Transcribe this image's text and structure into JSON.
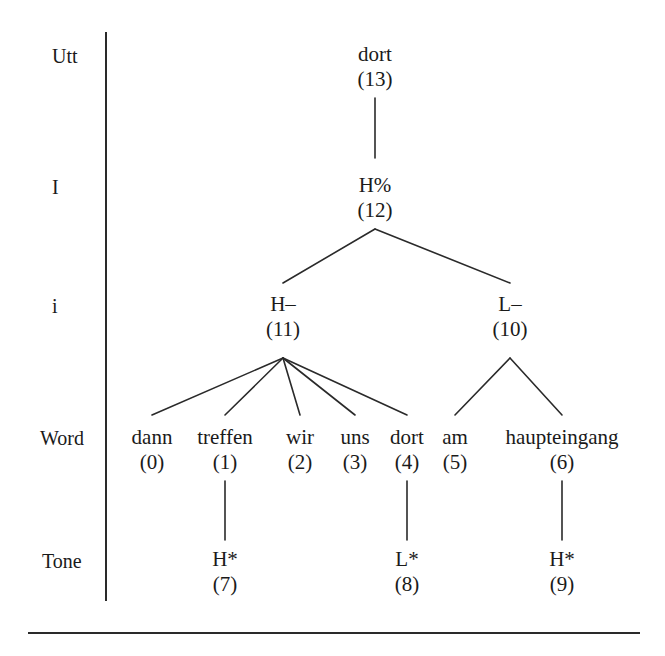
{
  "figure": {
    "ink_color": "#1a1a1a",
    "line_color": "#2a2a2a",
    "background": "#ffffff"
  },
  "tiers": [
    {
      "name": "utterance-tier",
      "label": "Utt"
    },
    {
      "name": "intonation-phrase-tier",
      "label": "I"
    },
    {
      "name": "intermediate-phrase-tier",
      "label": "i"
    },
    {
      "name": "word-tier",
      "label": "Word"
    },
    {
      "name": "tone-tier",
      "label": "Tone"
    }
  ],
  "nodes": [
    {
      "id": "n13",
      "label": "dort",
      "index": "(13)",
      "tier": "Utt",
      "x": 375,
      "y": 42
    },
    {
      "id": "n12",
      "label": "H%",
      "index": "(12)",
      "tier": "I",
      "x": 375,
      "y": 173
    },
    {
      "id": "n11",
      "label": "H–",
      "index": "(11)",
      "tier": "i",
      "x": 283,
      "y": 292
    },
    {
      "id": "n10",
      "label": "L–",
      "index": "(10)",
      "tier": "i",
      "x": 510,
      "y": 292
    },
    {
      "id": "w0",
      "label": "dann",
      "index": "(0)",
      "tier": "Word",
      "x": 152,
      "y": 425
    },
    {
      "id": "w1",
      "label": "treffen",
      "index": "(1)",
      "tier": "Word",
      "x": 225,
      "y": 425
    },
    {
      "id": "w2",
      "label": "wir",
      "index": "(2)",
      "tier": "Word",
      "x": 300,
      "y": 425
    },
    {
      "id": "w3",
      "label": "uns",
      "index": "(3)",
      "tier": "Word",
      "x": 355,
      "y": 425
    },
    {
      "id": "w4",
      "label": "dort",
      "index": "(4)",
      "tier": "Word",
      "x": 407,
      "y": 425
    },
    {
      "id": "w5",
      "label": "am",
      "index": "(5)",
      "tier": "Word",
      "x": 455,
      "y": 425
    },
    {
      "id": "w6",
      "label": "haupteingang",
      "index": "(6)",
      "tier": "Word",
      "x": 562,
      "y": 425
    },
    {
      "id": "t7",
      "label": "H*",
      "index": "(7)",
      "tier": "Tone",
      "x": 225,
      "y": 547
    },
    {
      "id": "t8",
      "label": "L*",
      "index": "(8)",
      "tier": "Tone",
      "x": 407,
      "y": 547
    },
    {
      "id": "t9",
      "label": "H*",
      "index": "(9)",
      "tier": "Tone",
      "x": 562,
      "y": 547
    }
  ],
  "edges": [
    {
      "from": "n13",
      "to": "n12",
      "x1": 375,
      "y1": 98,
      "x2": 375,
      "y2": 158
    },
    {
      "from": "n12",
      "to": "n11",
      "x1": 375,
      "y1": 229,
      "x2": 283,
      "y2": 283
    },
    {
      "from": "n12",
      "to": "n10",
      "x1": 375,
      "y1": 229,
      "x2": 510,
      "y2": 283
    },
    {
      "from": "n11",
      "to": "w0",
      "x1": 283,
      "y1": 358,
      "x2": 152,
      "y2": 415
    },
    {
      "from": "n11",
      "to": "w1",
      "x1": 283,
      "y1": 358,
      "x2": 225,
      "y2": 415
    },
    {
      "from": "n11",
      "to": "w2",
      "x1": 283,
      "y1": 358,
      "x2": 300,
      "y2": 415
    },
    {
      "from": "n11",
      "to": "w3",
      "x1": 283,
      "y1": 358,
      "x2": 355,
      "y2": 415
    },
    {
      "from": "n11",
      "to": "w4",
      "x1": 283,
      "y1": 358,
      "x2": 407,
      "y2": 415
    },
    {
      "from": "n10",
      "to": "w5",
      "x1": 510,
      "y1": 358,
      "x2": 455,
      "y2": 415
    },
    {
      "from": "n10",
      "to": "w6",
      "x1": 510,
      "y1": 358,
      "x2": 562,
      "y2": 415
    },
    {
      "from": "w1",
      "to": "t7",
      "x1": 225,
      "y1": 481,
      "x2": 225,
      "y2": 540
    },
    {
      "from": "w4",
      "to": "t8",
      "x1": 407,
      "y1": 481,
      "x2": 407,
      "y2": 540
    },
    {
      "from": "w6",
      "to": "t9",
      "x1": 562,
      "y1": 481,
      "x2": 562,
      "y2": 540
    }
  ],
  "tier_label_positions": [
    {
      "label": "Utt",
      "x": 52,
      "y": 46
    },
    {
      "label": "I",
      "x": 52,
      "y": 177
    },
    {
      "label": "i",
      "x": 52,
      "y": 296
    },
    {
      "label": "Word",
      "x": 40,
      "y": 428
    },
    {
      "label": "Tone",
      "x": 42,
      "y": 551
    }
  ],
  "axis": {
    "name": "tier-divider-line",
    "x": 105,
    "y_top": 32,
    "y_bottom": 601,
    "thickness": 2
  },
  "baseline": {
    "name": "figure-baseline-rule",
    "x_left": 28,
    "x_right": 640,
    "y": 632,
    "thickness": 2
  }
}
